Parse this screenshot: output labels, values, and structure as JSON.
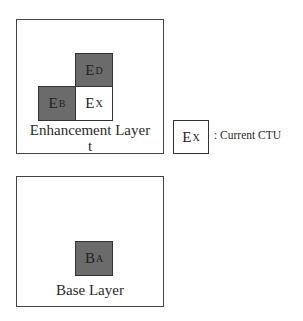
{
  "enhancement_layer": {
    "label_line1": "Enhancement Layer",
    "label_line2": "t",
    "cells": {
      "ED": {
        "main": "E",
        "sub": "D",
        "fill": "#6b6b6b"
      },
      "EB": {
        "main": "E",
        "sub": "B",
        "fill": "#6b6b6b"
      },
      "EX": {
        "main": "E",
        "sub": "X",
        "fill": "#ffffff"
      }
    }
  },
  "base_layer": {
    "label": "Base Layer",
    "cells": {
      "BA": {
        "main": "B",
        "sub": "A",
        "fill": "#6b6b6b"
      }
    }
  },
  "legend": {
    "box_main": "E",
    "box_sub": "X",
    "text": ": Current CTU"
  }
}
